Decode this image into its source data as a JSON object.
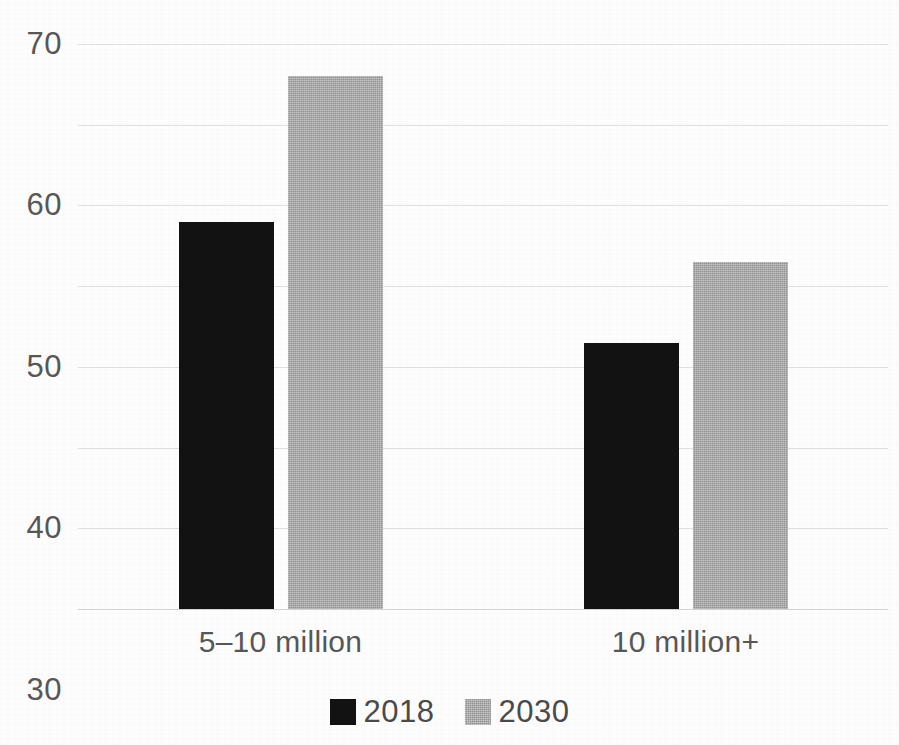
{
  "page": {
    "background_color": "#fdfdfd",
    "cut_off_title": "",
    "tick_text_color": "#575757"
  },
  "chart_data": {
    "type": "bar",
    "title": "",
    "subtitle": "",
    "xlabel": "",
    "ylabel": "",
    "categories": [
      "5–10 million",
      "10 million+"
    ],
    "series": [
      {
        "name": "2018",
        "color": "#121212",
        "values": [
          48,
          33
        ]
      },
      {
        "name": "2030",
        "color": "#a3a3a3",
        "values": [
          66,
          43
        ]
      }
    ],
    "ylim": [
      0,
      70
    ],
    "yticks": [
      0,
      10,
      20,
      30,
      40,
      50,
      60,
      70
    ],
    "ytick_labels": [
      "0",
      "10",
      "20",
      "30",
      "40",
      "50",
      "60",
      "70"
    ],
    "grid": true,
    "grid_axis": "y",
    "grid_color": "#dfdfdf",
    "legend": {
      "position": "bottom",
      "entries": [
        {
          "label": "2018",
          "color": "#121212"
        },
        {
          "label": "2030",
          "color": "#a3a3a3"
        }
      ]
    }
  }
}
